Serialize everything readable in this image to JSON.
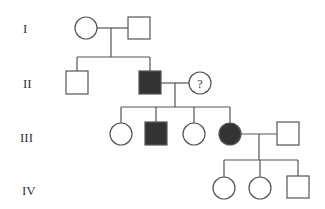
{
  "diagram": {
    "type": "pedigree",
    "colors": {
      "line": "#555555",
      "affected": "#333333",
      "unaffected": "#ffffff"
    },
    "generations": [
      {
        "label": "I",
        "y": 32
      },
      {
        "label": "II",
        "y": 87
      },
      {
        "label": "III",
        "y": 141
      },
      {
        "label": "IV",
        "y": 193
      }
    ],
    "individuals": [
      {
        "id": "I-1",
        "sex": "female",
        "affected": false,
        "x": 86,
        "y": 28
      },
      {
        "id": "I-2",
        "sex": "male",
        "affected": false,
        "x": 139,
        "y": 28
      },
      {
        "id": "II-1",
        "sex": "male",
        "affected": false,
        "x": 77,
        "y": 83
      },
      {
        "id": "II-2",
        "sex": "male",
        "affected": true,
        "x": 150,
        "y": 83
      },
      {
        "id": "II-3",
        "sex": "female",
        "affected": false,
        "x": 200,
        "y": 83,
        "label": "?"
      },
      {
        "id": "III-1",
        "sex": "female",
        "affected": false,
        "x": 121,
        "y": 134
      },
      {
        "id": "III-2",
        "sex": "male",
        "affected": true,
        "x": 156,
        "y": 134
      },
      {
        "id": "III-3",
        "sex": "female",
        "affected": false,
        "x": 194,
        "y": 134
      },
      {
        "id": "III-4",
        "sex": "female",
        "affected": true,
        "x": 230,
        "y": 134
      },
      {
        "id": "III-5",
        "sex": "male",
        "affected": false,
        "x": 288,
        "y": 134
      },
      {
        "id": "IV-1",
        "sex": "female",
        "affected": false,
        "x": 224,
        "y": 188
      },
      {
        "id": "IV-2",
        "sex": "female",
        "affected": false,
        "x": 260,
        "y": 188
      },
      {
        "id": "IV-3",
        "sex": "male",
        "affected": false,
        "x": 298,
        "y": 188
      }
    ]
  }
}
